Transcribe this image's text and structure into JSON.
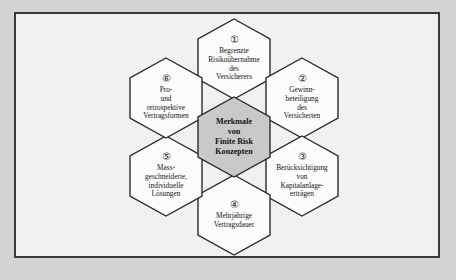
{
  "figure": {
    "type": "hexagon-cluster-diagram",
    "background_color": "#d4d4d4",
    "panel_color": "#f1f1f1",
    "border_color": "#3a3a3a",
    "hex_fill": "#fbfbfb",
    "hex_stroke": "#2b2b2b",
    "center_fill": "#c9c9c9"
  },
  "center": {
    "label": "Merkmale\nvon\nFinite Risk\nKonzepten"
  },
  "nodes": [
    {
      "number": "①",
      "number_value": 1,
      "label": "Begrenzte\nRisikoübernahme\ndes\nVersicherers",
      "position": "top"
    },
    {
      "number": "②",
      "number_value": 2,
      "label": "Gewinn-\nbeteiligung\ndes\nVersicherten",
      "position": "top-right"
    },
    {
      "number": "③",
      "number_value": 3,
      "label": "Berücksichtigung\nvon\nKapitalanlage-\nerträgen",
      "position": "bottom-right"
    },
    {
      "number": "④",
      "number_value": 4,
      "label": "Mehrjährige\nVertragsdauer",
      "position": "bottom"
    },
    {
      "number": "⑤",
      "number_value": 5,
      "label": "Mass-\ngeschneiderte,\nindividuelle\nLösungen",
      "position": "bottom-left"
    },
    {
      "number": "⑥",
      "number_value": 6,
      "label": "Pro-\nund\nretrospektive\nVertragsformen",
      "position": "top-left"
    }
  ]
}
